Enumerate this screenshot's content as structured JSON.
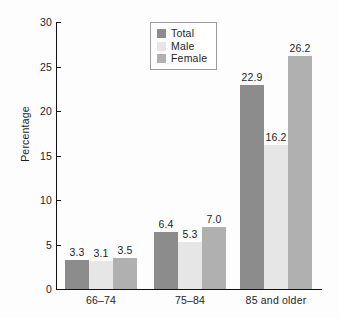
{
  "chart_data": {
    "type": "bar",
    "title": "",
    "xlabel": "",
    "ylabel": "Percentage",
    "ylim": [
      0,
      30
    ],
    "yticks": [
      0,
      5,
      10,
      15,
      20,
      25,
      30
    ],
    "ytick_labels": [
      "0",
      "5",
      "10",
      "15",
      "20",
      "25",
      "30"
    ],
    "grid": false,
    "legend_position": "top-center",
    "categories": [
      "66–74",
      "75–84",
      "85 and older"
    ],
    "series": [
      {
        "name": "Total",
        "color": "#8c8c8c",
        "values": [
          3.3,
          3.1,
          22.9
        ],
        "labels": [
          "3.3",
          "3.1",
          "22.9"
        ]
      },
      {
        "name": "Male",
        "color": "#e6e6e6",
        "values": [
          3.1,
          5.3,
          16.2
        ],
        "labels": [
          "3.1",
          "5.3",
          "16.2"
        ]
      },
      {
        "name": "Female",
        "color": "#b0b0b0",
        "values": [
          3.5,
          7.0,
          26.2
        ],
        "labels": [
          "3.5",
          "7.0",
          "26.2"
        ]
      }
    ],
    "bars": [
      {
        "group": "66–74",
        "items": [
          {
            "series": "Total",
            "value": 3.3,
            "label": "3.3",
            "color": "#8c8c8c"
          },
          {
            "series": "Male",
            "value": 3.1,
            "label": "3.1",
            "color": "#e6e6e6"
          },
          {
            "series": "Female",
            "value": 3.5,
            "label": "3.5",
            "color": "#b0b0b0"
          }
        ]
      },
      {
        "group": "75–84",
        "items": [
          {
            "series": "Total",
            "value": 6.4,
            "label": "6.4",
            "color": "#8c8c8c"
          },
          {
            "series": "Male",
            "value": 5.3,
            "label": "5.3",
            "color": "#e6e6e6"
          },
          {
            "series": "Female",
            "value": 7.0,
            "label": "7.0",
            "color": "#b0b0b0"
          }
        ]
      },
      {
        "group": "85 and older",
        "items": [
          {
            "series": "Total",
            "value": 22.9,
            "label": "22.9",
            "color": "#8c8c8c"
          },
          {
            "series": "Male",
            "value": 16.2,
            "label": "16.2",
            "color": "#e6e6e6"
          },
          {
            "series": "Female",
            "value": 26.2,
            "label": "26.2",
            "color": "#b0b0b0"
          }
        ]
      }
    ]
  },
  "legend": {
    "items": [
      {
        "label": "Total",
        "color": "#8c8c8c"
      },
      {
        "label": "Male",
        "color": "#e6e6e6"
      },
      {
        "label": "Female",
        "color": "#b0b0b0"
      }
    ]
  },
  "axes": {
    "y_title": "Percentage"
  },
  "colors": {
    "background": "#fdfdfd",
    "axis": "#111111",
    "text": "#1d1d1d",
    "legend_border": "#9a9a9a",
    "total": "#8c8c8c",
    "male": "#e6e6e6",
    "female": "#b0b0b0"
  }
}
